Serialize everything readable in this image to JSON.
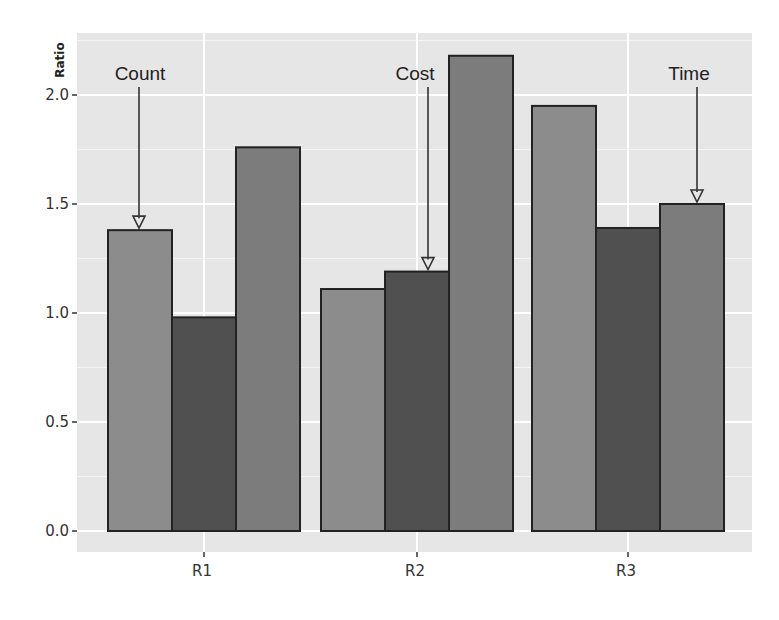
{
  "chart_data": {
    "type": "bar",
    "title": "",
    "xlabel": "",
    "ylabel": "Ratio",
    "ylim": [
      -0.05,
      2.2
    ],
    "yticks": [
      0.0,
      0.5,
      1.0,
      1.5,
      2.0
    ],
    "ytick_labels": [
      "0.0",
      "0.5",
      "1.0",
      "1.5",
      "2.0"
    ],
    "categories": [
      "R1",
      "R2",
      "R3"
    ],
    "series": [
      {
        "name": "Count",
        "color": "#8c8c8c",
        "values": [
          1.38,
          1.11,
          1.95
        ]
      },
      {
        "name": "Cost",
        "color": "#505050",
        "values": [
          0.98,
          1.19,
          1.39
        ]
      },
      {
        "name": "Time",
        "color": "#7c7c7c",
        "values": [
          1.76,
          2.18,
          1.5
        ]
      }
    ],
    "annotations": [
      {
        "text": "Count",
        "category": "R1",
        "series": "Count",
        "arrow": true
      },
      {
        "text": "Cost",
        "category": "R2",
        "series": "Cost",
        "arrow": true
      },
      {
        "text": "Time",
        "category": "R3",
        "series": "Time",
        "arrow": true
      }
    ],
    "grid": true,
    "legend": "none",
    "panel_background": "#e6e6e6",
    "grid_color": "#ffffff"
  }
}
